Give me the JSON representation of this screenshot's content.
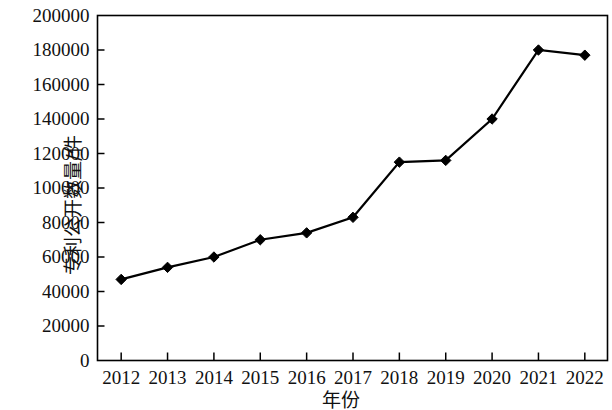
{
  "chart_data": {
    "type": "line",
    "title": "",
    "xlabel": "年份",
    "ylabel": "专利公开数量/件",
    "categories": [
      "2012",
      "2013",
      "2014",
      "2015",
      "2016",
      "2017",
      "2018",
      "2019",
      "2020",
      "2021",
      "2022"
    ],
    "values": [
      47000,
      54000,
      60000,
      70000,
      74000,
      83000,
      115000,
      116000,
      140000,
      180000,
      177000
    ],
    "series": [
      {
        "name": "专利公开数量",
        "values": [
          47000,
          54000,
          60000,
          70000,
          74000,
          83000,
          115000,
          116000,
          140000,
          180000,
          177000
        ]
      }
    ],
    "ylim": [
      0,
      200000
    ],
    "y_ticks": [
      0,
      20000,
      40000,
      60000,
      80000,
      100000,
      120000,
      140000,
      160000,
      180000,
      200000
    ],
    "y_tick_labels": [
      "0",
      "20000",
      "40000",
      "60000",
      "80000",
      "100000",
      "120000",
      "140000",
      "160000",
      "180000",
      "200000"
    ],
    "x_tick_labels": [
      "2012",
      "2013",
      "2014",
      "2015",
      "2016",
      "2017",
      "2018",
      "2019",
      "2020",
      "2021",
      "2022"
    ],
    "grid": false,
    "legend": false,
    "legend_position": "none",
    "marker": "diamond",
    "line_color": "#000000",
    "marker_color": "#000000",
    "background_color": "#ffffff",
    "axis_color": "#000000"
  }
}
